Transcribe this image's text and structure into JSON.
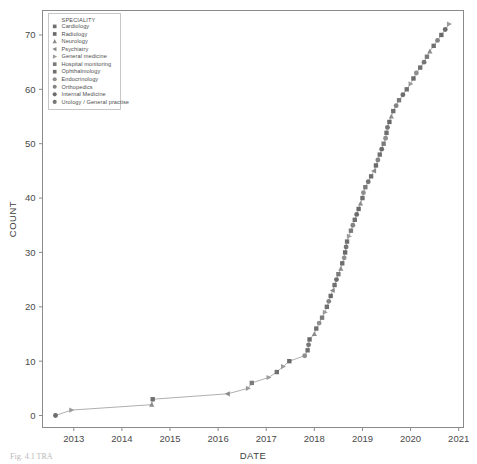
{
  "figure": {
    "caption_partial": "Fig. 4.1  TRA",
    "background": "#ffffff"
  },
  "legend": {
    "title": "SPECIALITY",
    "items": [
      {
        "label": "Cardiology",
        "marker": "square",
        "color": "#6f6f6f"
      },
      {
        "label": "Radiology",
        "marker": "square",
        "color": "#6a6a6a"
      },
      {
        "label": "Neurology",
        "marker": "triangle-up",
        "color": "#8c8c8c"
      },
      {
        "label": "Psychiatry",
        "marker": "triangle-left",
        "color": "#888888"
      },
      {
        "label": "General medicine",
        "marker": "triangle-right",
        "color": "#9a9a9a"
      },
      {
        "label": "Hospital monitoring",
        "marker": "square",
        "color": "#7b7b7b"
      },
      {
        "label": "Ophthalmology",
        "marker": "square",
        "color": "#707070"
      },
      {
        "label": "Endocrinology",
        "marker": "circle",
        "color": "#8f8f8f"
      },
      {
        "label": "Orthopedics",
        "marker": "circle",
        "color": "#848484"
      },
      {
        "label": "Internal Medicine",
        "marker": "circle",
        "color": "#6d6d6d"
      },
      {
        "label": "Urology / General practise",
        "marker": "circle",
        "color": "#767676"
      }
    ]
  },
  "chart_data": {
    "type": "scatter",
    "title": "",
    "xlabel": "DATE",
    "ylabel": "COUNT",
    "xlim": [
      2012.35,
      2021.1
    ],
    "ylim": [
      -2.2,
      74.5
    ],
    "xticks": [
      2013,
      2014,
      2015,
      2016,
      2017,
      2018,
      2019,
      2020,
      2021
    ],
    "yticks": [
      0,
      10,
      20,
      30,
      40,
      50,
      60,
      70
    ],
    "xtick_labels": [
      "2013",
      "2014",
      "2015",
      "2016",
      "2017",
      "2018",
      "2019",
      "2020",
      "2021"
    ],
    "ytick_labels": [
      "0",
      "10",
      "20",
      "30",
      "40",
      "50",
      "60",
      "70"
    ],
    "grid": false,
    "legend_position": "upper-left-inside",
    "line_connects_points": true,
    "points": [
      {
        "x": 2012.62,
        "y": 0,
        "marker": "circle",
        "color": "#6d6d6d"
      },
      {
        "x": 2012.95,
        "y": 1,
        "marker": "triangle-right",
        "color": "#9a9a9a"
      },
      {
        "x": 2014.62,
        "y": 2,
        "marker": "triangle-up",
        "color": "#8c8c8c"
      },
      {
        "x": 2014.64,
        "y": 3,
        "marker": "square",
        "color": "#6f6f6f"
      },
      {
        "x": 2016.2,
        "y": 4,
        "marker": "triangle-left",
        "color": "#888888"
      },
      {
        "x": 2016.62,
        "y": 5,
        "marker": "triangle-right",
        "color": "#9a9a9a"
      },
      {
        "x": 2016.7,
        "y": 6,
        "marker": "square",
        "color": "#7b7b7b"
      },
      {
        "x": 2017.05,
        "y": 7,
        "marker": "triangle-right",
        "color": "#9a9a9a"
      },
      {
        "x": 2017.22,
        "y": 8,
        "marker": "square",
        "color": "#707070"
      },
      {
        "x": 2017.35,
        "y": 9,
        "marker": "triangle-right",
        "color": "#9a9a9a"
      },
      {
        "x": 2017.48,
        "y": 10,
        "marker": "square",
        "color": "#6a6a6a"
      },
      {
        "x": 2017.8,
        "y": 11,
        "marker": "circle",
        "color": "#8f8f8f"
      },
      {
        "x": 2017.86,
        "y": 12,
        "marker": "square",
        "color": "#6f6f6f"
      },
      {
        "x": 2017.88,
        "y": 13,
        "marker": "circle",
        "color": "#767676"
      },
      {
        "x": 2017.9,
        "y": 14,
        "marker": "square",
        "color": "#6a6a6a"
      },
      {
        "x": 2018.0,
        "y": 15,
        "marker": "triangle-up",
        "color": "#8c8c8c"
      },
      {
        "x": 2018.04,
        "y": 16,
        "marker": "square",
        "color": "#707070"
      },
      {
        "x": 2018.1,
        "y": 17,
        "marker": "circle",
        "color": "#8f8f8f"
      },
      {
        "x": 2018.16,
        "y": 18,
        "marker": "square",
        "color": "#7b7b7b"
      },
      {
        "x": 2018.22,
        "y": 19,
        "marker": "triangle-right",
        "color": "#9a9a9a"
      },
      {
        "x": 2018.26,
        "y": 20,
        "marker": "square",
        "color": "#6f6f6f"
      },
      {
        "x": 2018.3,
        "y": 21,
        "marker": "circle",
        "color": "#848484"
      },
      {
        "x": 2018.34,
        "y": 22,
        "marker": "square",
        "color": "#6a6a6a"
      },
      {
        "x": 2018.38,
        "y": 23,
        "marker": "triangle-left",
        "color": "#888888"
      },
      {
        "x": 2018.42,
        "y": 24,
        "marker": "square",
        "color": "#707070"
      },
      {
        "x": 2018.46,
        "y": 25,
        "marker": "circle",
        "color": "#6d6d6d"
      },
      {
        "x": 2018.5,
        "y": 26,
        "marker": "square",
        "color": "#7b7b7b"
      },
      {
        "x": 2018.55,
        "y": 27,
        "marker": "triangle-up",
        "color": "#8c8c8c"
      },
      {
        "x": 2018.58,
        "y": 28,
        "marker": "square",
        "color": "#6f6f6f"
      },
      {
        "x": 2018.62,
        "y": 29,
        "marker": "circle",
        "color": "#8f8f8f"
      },
      {
        "x": 2018.64,
        "y": 30,
        "marker": "square",
        "color": "#6a6a6a"
      },
      {
        "x": 2018.66,
        "y": 31,
        "marker": "circle",
        "color": "#767676"
      },
      {
        "x": 2018.68,
        "y": 32,
        "marker": "square",
        "color": "#707070"
      },
      {
        "x": 2018.72,
        "y": 33,
        "marker": "triangle-right",
        "color": "#9a9a9a"
      },
      {
        "x": 2018.76,
        "y": 34,
        "marker": "square",
        "color": "#7b7b7b"
      },
      {
        "x": 2018.8,
        "y": 35,
        "marker": "circle",
        "color": "#848484"
      },
      {
        "x": 2018.84,
        "y": 36,
        "marker": "square",
        "color": "#6f6f6f"
      },
      {
        "x": 2018.88,
        "y": 37,
        "marker": "circle",
        "color": "#6d6d6d"
      },
      {
        "x": 2018.92,
        "y": 38,
        "marker": "square",
        "color": "#6a6a6a"
      },
      {
        "x": 2018.96,
        "y": 39,
        "marker": "triangle-up",
        "color": "#8c8c8c"
      },
      {
        "x": 2019.0,
        "y": 40,
        "marker": "square",
        "color": "#707070"
      },
      {
        "x": 2019.02,
        "y": 41,
        "marker": "circle",
        "color": "#8f8f8f"
      },
      {
        "x": 2019.06,
        "y": 42,
        "marker": "square",
        "color": "#7b7b7b"
      },
      {
        "x": 2019.12,
        "y": 43,
        "marker": "circle",
        "color": "#767676"
      },
      {
        "x": 2019.18,
        "y": 44,
        "marker": "square",
        "color": "#6f6f6f"
      },
      {
        "x": 2019.24,
        "y": 45,
        "marker": "triangle-left",
        "color": "#888888"
      },
      {
        "x": 2019.28,
        "y": 46,
        "marker": "square",
        "color": "#6a6a6a"
      },
      {
        "x": 2019.32,
        "y": 47,
        "marker": "circle",
        "color": "#848484"
      },
      {
        "x": 2019.36,
        "y": 48,
        "marker": "square",
        "color": "#707070"
      },
      {
        "x": 2019.4,
        "y": 49,
        "marker": "circle",
        "color": "#6d6d6d"
      },
      {
        "x": 2019.44,
        "y": 50,
        "marker": "square",
        "color": "#7b7b7b"
      },
      {
        "x": 2019.48,
        "y": 51,
        "marker": "circle",
        "color": "#8f8f8f"
      },
      {
        "x": 2019.5,
        "y": 52,
        "marker": "square",
        "color": "#6f6f6f"
      },
      {
        "x": 2019.52,
        "y": 53,
        "marker": "circle",
        "color": "#767676"
      },
      {
        "x": 2019.56,
        "y": 54,
        "marker": "square",
        "color": "#6a6a6a"
      },
      {
        "x": 2019.6,
        "y": 55,
        "marker": "triangle-up",
        "color": "#8c8c8c"
      },
      {
        "x": 2019.64,
        "y": 56,
        "marker": "square",
        "color": "#707070"
      },
      {
        "x": 2019.7,
        "y": 57,
        "marker": "circle",
        "color": "#848484"
      },
      {
        "x": 2019.76,
        "y": 58,
        "marker": "square",
        "color": "#7b7b7b"
      },
      {
        "x": 2019.84,
        "y": 59,
        "marker": "circle",
        "color": "#6d6d6d"
      },
      {
        "x": 2019.92,
        "y": 60,
        "marker": "square",
        "color": "#6f6f6f"
      },
      {
        "x": 2020.0,
        "y": 61,
        "marker": "triangle-right",
        "color": "#9a9a9a"
      },
      {
        "x": 2020.06,
        "y": 62,
        "marker": "square",
        "color": "#6a6a6a"
      },
      {
        "x": 2020.12,
        "y": 63,
        "marker": "circle",
        "color": "#8f8f8f"
      },
      {
        "x": 2020.2,
        "y": 64,
        "marker": "square",
        "color": "#707070"
      },
      {
        "x": 2020.28,
        "y": 65,
        "marker": "circle",
        "color": "#767676"
      },
      {
        "x": 2020.34,
        "y": 66,
        "marker": "square",
        "color": "#7b7b7b"
      },
      {
        "x": 2020.4,
        "y": 67,
        "marker": "triangle-up",
        "color": "#8c8c8c"
      },
      {
        "x": 2020.48,
        "y": 68,
        "marker": "square",
        "color": "#6f6f6f"
      },
      {
        "x": 2020.56,
        "y": 69,
        "marker": "circle",
        "color": "#848484"
      },
      {
        "x": 2020.64,
        "y": 70,
        "marker": "square",
        "color": "#6a6a6a"
      },
      {
        "x": 2020.72,
        "y": 71,
        "marker": "circle",
        "color": "#6d6d6d"
      },
      {
        "x": 2020.8,
        "y": 72,
        "marker": "triangle-right",
        "color": "#9a9a9a"
      }
    ]
  }
}
